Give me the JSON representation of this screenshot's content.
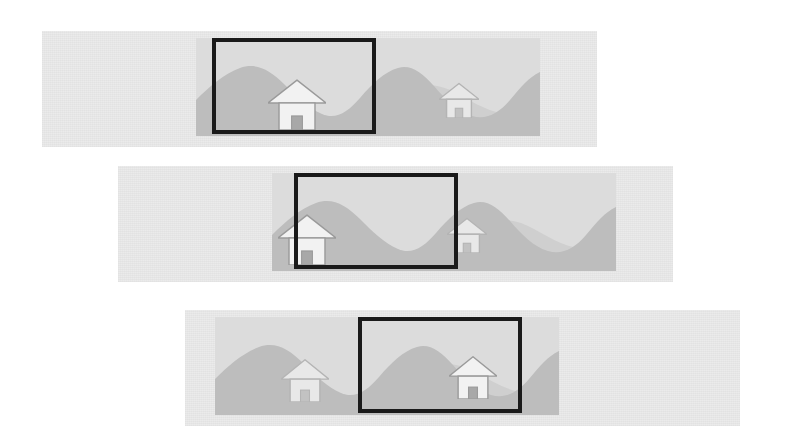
{
  "figure": {
    "background_color": "#ffffff",
    "width": 798,
    "height": 444,
    "band_color": "#ebebeb",
    "scene_color": "#dcdcdc",
    "mountain_near_color": "#bdbdbd",
    "mountain_far_color": "#cfcfcf",
    "house_fill_color": "#f2f2f2",
    "house_stroke_color": "#9a9a9a",
    "house_door_color": "#a8a8a8",
    "crop_border_color": "#1a1a1a",
    "crop_border_width": 4
  },
  "panels": [
    {
      "id": "panel-1",
      "label": "Crop window at left position",
      "band": {
        "x": 42,
        "y": 31,
        "width": 555,
        "height": 116
      },
      "scene": {
        "x": 196,
        "y": 38,
        "width": 344,
        "height": 98
      },
      "crop": {
        "x": 212,
        "y": 38,
        "width": 164,
        "height": 96
      },
      "houses": [
        {
          "name": "house-large",
          "x": 268,
          "y": 78,
          "width": 58,
          "height": 52,
          "emphasis": "strong"
        },
        {
          "name": "house-small",
          "x": 439,
          "y": 82,
          "width": 40,
          "height": 36,
          "emphasis": "faint"
        }
      ]
    },
    {
      "id": "panel-2",
      "label": "Crop window at center position",
      "band": {
        "x": 118,
        "y": 166,
        "width": 555,
        "height": 116
      },
      "scene": {
        "x": 272,
        "y": 173,
        "width": 344,
        "height": 98
      },
      "crop": {
        "x": 294,
        "y": 173,
        "width": 164,
        "height": 96
      },
      "houses": [
        {
          "name": "house-large",
          "x": 278,
          "y": 213,
          "width": 58,
          "height": 52,
          "emphasis": "strong"
        },
        {
          "name": "house-small",
          "x": 447,
          "y": 217,
          "width": 40,
          "height": 36,
          "emphasis": "faint"
        }
      ]
    },
    {
      "id": "panel-3",
      "label": "Crop window at right position",
      "band": {
        "x": 185,
        "y": 310,
        "width": 555,
        "height": 116
      },
      "scene": {
        "x": 215,
        "y": 317,
        "width": 344,
        "height": 98
      },
      "crop": {
        "x": 358,
        "y": 317,
        "width": 164,
        "height": 96
      },
      "houses": [
        {
          "name": "house-small",
          "x": 281,
          "y": 358,
          "width": 48,
          "height": 44,
          "emphasis": "faint"
        },
        {
          "name": "house-large",
          "x": 449,
          "y": 355,
          "width": 48,
          "height": 44,
          "emphasis": "strong"
        }
      ]
    }
  ],
  "terrain": {
    "near_ridge_path": "M0,98 L0,62 C14,48 28,36 44,30 C60,24 74,32 88,46 C100,58 112,70 126,76 C140,82 152,74 164,60 C176,46 188,34 202,30 C214,26 226,34 238,48 C250,62 262,74 276,78 C290,82 302,76 314,62 C326,48 332,40 344,34 L344,98 Z",
    "far_ridge_path": "M0,98 L0,74 C18,62 36,50 56,48 C76,46 92,58 108,68 C124,78 140,82 158,78 C176,74 190,60 208,52 C226,44 244,46 262,56 C280,66 296,76 316,76 C328,76 336,72 344,66 L344,98 Z"
  }
}
